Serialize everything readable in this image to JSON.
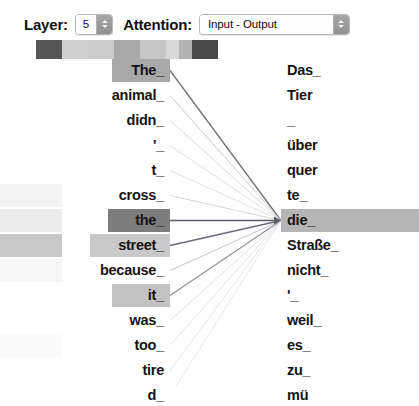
{
  "toolbar": {
    "layer_label": "Layer:",
    "layer_value": "5",
    "attention_label": "Attention:",
    "attention_value": "Input - Output",
    "stepper_icon": "stepper-up-down-icon"
  },
  "swatch_strip": {
    "name": "head-color-swatches",
    "cells": [
      {
        "color": "#555555",
        "width": 26
      },
      {
        "color": "#cfcfcf",
        "width": 26
      },
      {
        "color": "#cbcbcb",
        "width": 26
      },
      {
        "color": "#a9a9a9",
        "width": 26
      },
      {
        "color": "#c6c6c6",
        "width": 26
      },
      {
        "color": "#d7d7d7",
        "width": 13
      },
      {
        "color": "#b3b3b3",
        "width": 13
      },
      {
        "color": "#4a4a4a",
        "width": 26
      }
    ]
  },
  "attention_view": {
    "source_column_name": "input-tokens-column",
    "target_column_name": "output-tokens-column",
    "source_tokens": [
      {
        "text": "The_",
        "highlight": "#a8a8a8",
        "hl_width": 58,
        "edge_band": null
      },
      {
        "text": "animal_",
        "highlight": null,
        "hl_width": 0,
        "edge_band": null
      },
      {
        "text": "didn_",
        "highlight": null,
        "hl_width": 0,
        "edge_band": null
      },
      {
        "text": "'_",
        "highlight": null,
        "hl_width": 0,
        "edge_band": null
      },
      {
        "text": "t_",
        "highlight": null,
        "hl_width": 0,
        "edge_band": null
      },
      {
        "text": "cross_",
        "highlight": null,
        "hl_width": 0,
        "edge_band": "#f3f3f3"
      },
      {
        "text": "the_",
        "highlight": "#7d7d7d",
        "hl_width": 62,
        "edge_band": "#ececec"
      },
      {
        "text": "street_",
        "highlight": "#c9c9c9",
        "hl_width": 80,
        "edge_band": "#c9c9c9"
      },
      {
        "text": "because_",
        "highlight": null,
        "hl_width": 0,
        "edge_band": "#f6f6f6"
      },
      {
        "text": "it_",
        "highlight": "#c2c2c2",
        "hl_width": 58,
        "edge_band": null
      },
      {
        "text": "was_",
        "highlight": null,
        "hl_width": 0,
        "edge_band": null
      },
      {
        "text": "too_",
        "highlight": null,
        "hl_width": 0,
        "edge_band": "#fafafa"
      },
      {
        "text": "tire",
        "highlight": null,
        "hl_width": 0,
        "edge_band": null
      },
      {
        "text": "d_",
        "highlight": null,
        "hl_width": 0,
        "edge_band": null
      }
    ],
    "target_tokens": [
      {
        "text": "Das_",
        "highlight": null
      },
      {
        "text": "Tier",
        "highlight": null
      },
      {
        "text": "_",
        "highlight": null
      },
      {
        "text": "über",
        "highlight": null
      },
      {
        "text": "quer",
        "highlight": null
      },
      {
        "text": "te_",
        "highlight": null
      },
      {
        "text": "die_",
        "highlight": "#b5b5b5"
      },
      {
        "text": "Straße_",
        "highlight": null
      },
      {
        "text": "nicht_",
        "highlight": null
      },
      {
        "text": "'_",
        "highlight": null
      },
      {
        "text": "weil_",
        "highlight": null
      },
      {
        "text": "es_",
        "highlight": null
      },
      {
        "text": "zu_",
        "highlight": null
      },
      {
        "text": "mü",
        "highlight": null
      }
    ],
    "focus_target_index": 6,
    "attention_edges": [
      {
        "from": 0,
        "to": 6,
        "weight": 0.62,
        "color": "#6f6f7a"
      },
      {
        "from": 1,
        "to": 6,
        "weight": 0.16,
        "color": "#b9b9c2"
      },
      {
        "from": 2,
        "to": 6,
        "weight": 0.1,
        "color": "#cacad2"
      },
      {
        "from": 3,
        "to": 6,
        "weight": 0.08,
        "color": "#d2d2d8"
      },
      {
        "from": 4,
        "to": 6,
        "weight": 0.08,
        "color": "#d2d2d8"
      },
      {
        "from": 5,
        "to": 6,
        "weight": 0.12,
        "color": "#c4c4cc"
      },
      {
        "from": 6,
        "to": 6,
        "weight": 0.95,
        "color": "#5e5e6b"
      },
      {
        "from": 7,
        "to": 6,
        "weight": 0.7,
        "color": "#6b6b78"
      },
      {
        "from": 8,
        "to": 6,
        "weight": 0.18,
        "color": "#b4b4be"
      },
      {
        "from": 9,
        "to": 6,
        "weight": 0.48,
        "color": "#8f8f9b"
      },
      {
        "from": 10,
        "to": 6,
        "weight": 0.09,
        "color": "#d0d0d6"
      },
      {
        "from": 11,
        "to": 6,
        "weight": 0.07,
        "color": "#d6d6dc"
      },
      {
        "from": 12,
        "to": 6,
        "weight": 0.06,
        "color": "#dadade"
      },
      {
        "from": 13,
        "to": 6,
        "weight": 0.05,
        "color": "#dedee2"
      }
    ]
  }
}
